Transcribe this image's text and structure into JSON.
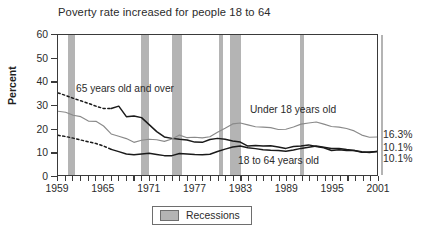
{
  "chart_data": {
    "type": "line",
    "title": "Poverty rate increased for people 18 to 64",
    "xlabel": "",
    "ylabel": "Percent",
    "xlim": [
      1959,
      2001
    ],
    "ylim": [
      0,
      60
    ],
    "ytick_labels": [
      "60",
      "50",
      "40",
      "30",
      "20",
      "10",
      "0"
    ],
    "ytick_values": [
      60,
      50,
      40,
      30,
      20,
      10,
      0
    ],
    "xtick_labels": [
      "1959",
      "1965",
      "1971",
      "1977",
      "1983",
      "1989",
      "1995",
      "2001"
    ],
    "xtick_values": [
      1959,
      1965,
      1971,
      1977,
      1983,
      1989,
      1995,
      2001
    ],
    "grid": false,
    "legend_position": "below-plot",
    "x": [
      1959,
      1960,
      1961,
      1962,
      1963,
      1964,
      1965,
      1966,
      1967,
      1968,
      1969,
      1970,
      1971,
      1972,
      1973,
      1974,
      1975,
      1976,
      1977,
      1978,
      1979,
      1980,
      1981,
      1982,
      1983,
      1984,
      1985,
      1986,
      1987,
      1988,
      1989,
      1990,
      1991,
      1992,
      1993,
      1994,
      1995,
      1996,
      1997,
      1998,
      1999,
      2000,
      2001
    ],
    "series": [
      {
        "name": "65 years old and over",
        "color": "#1a1a1a",
        "style": "dashed-then-solid",
        "dashed_until": 1965,
        "end_value": 10.1,
        "values": [
          35.2,
          34.1,
          32.9,
          31.8,
          30.7,
          29.5,
          28.5,
          28.5,
          29.5,
          25.0,
          25.3,
          24.6,
          21.6,
          18.6,
          16.3,
          15.7,
          15.3,
          15.0,
          14.1,
          14.0,
          15.2,
          15.7,
          15.3,
          14.6,
          14.1,
          12.4,
          12.6,
          12.4,
          12.5,
          12.0,
          11.4,
          12.2,
          12.4,
          12.9,
          12.2,
          11.7,
          10.5,
          10.8,
          10.5,
          10.5,
          9.7,
          9.9,
          10.1
        ]
      },
      {
        "name": "Under 18 years old",
        "color": "#8a8a8a",
        "style": "solid",
        "end_value": 16.3,
        "values": [
          27.3,
          26.9,
          25.6,
          25.0,
          23.1,
          23.0,
          21.0,
          17.6,
          16.6,
          15.6,
          14.0,
          14.9,
          15.3,
          15.1,
          14.4,
          15.4,
          17.1,
          16.0,
          16.2,
          15.9,
          16.4,
          18.3,
          20.0,
          21.9,
          22.3,
          21.5,
          20.7,
          20.5,
          20.3,
          19.5,
          19.6,
          20.6,
          21.8,
          22.3,
          22.7,
          21.8,
          20.8,
          20.5,
          19.9,
          18.9,
          17.1,
          16.2,
          16.3
        ]
      },
      {
        "name": "18 to 64 years old",
        "color": "#1a1a1a",
        "style": "dashed-then-solid",
        "dashed_until": 1965,
        "end_value": 10.1,
        "values": [
          17.0,
          16.5,
          15.8,
          15.0,
          14.2,
          13.5,
          12.4,
          11.0,
          10.0,
          9.0,
          8.7,
          9.0,
          9.3,
          8.8,
          8.3,
          8.3,
          9.2,
          9.0,
          8.8,
          8.7,
          8.9,
          10.1,
          11.1,
          12.0,
          12.4,
          11.7,
          11.3,
          10.8,
          10.6,
          10.5,
          10.2,
          10.7,
          11.4,
          11.9,
          12.4,
          11.9,
          11.4,
          11.4,
          10.9,
          10.5,
          10.0,
          9.6,
          10.1
        ]
      }
    ],
    "end_labels": [
      {
        "text": "16.3%",
        "value": 16.3,
        "series": "Under 18 years old"
      },
      {
        "text": "10.1%",
        "value": 10.1,
        "series": "65 years old and over"
      },
      {
        "text": "10.1%",
        "value": 10.1,
        "series": "18 to 64 years old"
      }
    ],
    "annotations": [
      {
        "id": "ann-65",
        "text": "65 years old and over"
      },
      {
        "id": "ann-under18",
        "text": "Under 18 years old"
      },
      {
        "id": "ann-18to64",
        "text": "18 to 64 years old"
      }
    ],
    "legend": {
      "label": "Recessions",
      "swatch_color": "#b4b4b4"
    },
    "recessions": [
      {
        "start": 1960.3,
        "end": 1961.2
      },
      {
        "start": 1969.9,
        "end": 1970.9
      },
      {
        "start": 1973.9,
        "end": 1975.2
      },
      {
        "start": 1980.1,
        "end": 1980.6
      },
      {
        "start": 1981.5,
        "end": 1982.9
      },
      {
        "start": 1990.6,
        "end": 1991.2
      },
      {
        "start": 2001.2,
        "end": 2001.8
      }
    ]
  },
  "colors": {
    "recession_band": "#b4b4b4",
    "axis": "#3a3a3a",
    "gray_series": "#8a8a8a",
    "black_series": "#1a1a1a",
    "background": "#ffffff"
  }
}
